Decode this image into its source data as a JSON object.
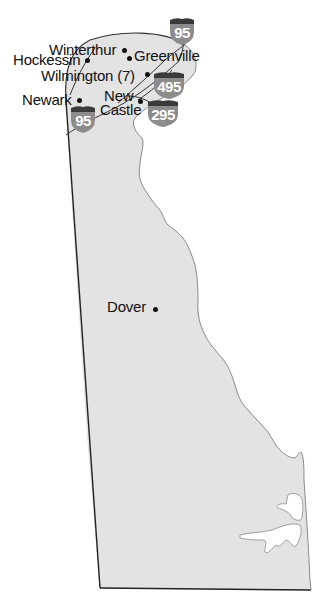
{
  "map": {
    "region": "Delaware",
    "colors": {
      "land_fill": "#e3e3e3",
      "border": "#222222",
      "coastline": "#8a8a8a",
      "shield_body": "#8c8c8c",
      "shield_cap": "#3a3a3a",
      "shield_text": "#ffffff",
      "text": "#111111"
    },
    "cities": [
      {
        "name": "Winterthur",
        "label": "Winterthur"
      },
      {
        "name": "Hockessin",
        "label": "Hockessin"
      },
      {
        "name": "Greenville",
        "label": "Greenville"
      },
      {
        "name": "Wilmington",
        "label": "Wilmington (7)"
      },
      {
        "name": "Newark",
        "label": "Newark"
      },
      {
        "name": "New Castle",
        "label_line1": "New",
        "label_line2": "Castle"
      },
      {
        "name": "Dover",
        "label": "Dover"
      }
    ],
    "highways": [
      {
        "type": "interstate",
        "number": "95",
        "position": "north"
      },
      {
        "type": "interstate",
        "number": "495",
        "position": "east"
      },
      {
        "type": "interstate",
        "number": "295",
        "position": "south-east"
      },
      {
        "type": "interstate",
        "number": "95",
        "position": "south-west"
      }
    ]
  }
}
